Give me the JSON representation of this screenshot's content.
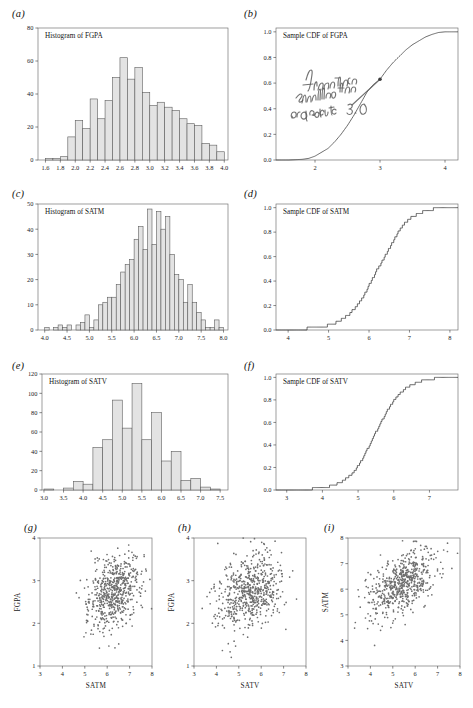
{
  "figure": {
    "panel_labels": [
      "(a)",
      "(b)",
      "(c)",
      "(d)",
      "(e)",
      "(f)",
      "(g)",
      "(h)",
      "(i)"
    ],
    "background": "#ffffff",
    "bar_fill": "#e3e3e3",
    "bar_stroke": "#5d5d5d",
    "line_color": "#3a3a3a",
    "dot_color": "#6e6e6e"
  },
  "annotation": {
    "text": "fraction smaller than or equal to 3.0",
    "panel": "(b)",
    "marker_x": 3.0,
    "marker_y": 0.63
  },
  "chart_data": [
    {
      "panel": "(a)",
      "type": "bar",
      "title": "Histogram of FGPA",
      "xlabel": "",
      "ylabel": "",
      "xlim": [
        1.5,
        4.05
      ],
      "ylim": [
        0,
        80
      ],
      "xticks": [
        1.6,
        1.8,
        2.0,
        2.2,
        2.4,
        2.6,
        2.8,
        3.0,
        3.2,
        3.4,
        3.6,
        3.8,
        4.0
      ],
      "xticklabels": [
        "1.6",
        "1.8",
        "2.0",
        "2.2",
        "2.4",
        "2.6",
        "2.8",
        "3.0",
        "3.2",
        "3.4",
        "3.6",
        "3.8",
        "4.0"
      ],
      "yticks": [
        0,
        20,
        40,
        60,
        80
      ],
      "yticklabels": [
        "0",
        "20",
        "40",
        "60",
        "80"
      ],
      "bin_width": 0.1,
      "bin_starts": [
        1.5,
        1.6,
        1.7,
        1.8,
        1.9,
        2.0,
        2.1,
        2.2,
        2.3,
        2.4,
        2.5,
        2.6,
        2.7,
        2.8,
        2.9,
        3.0,
        3.1,
        3.2,
        3.3,
        3.4,
        3.5,
        3.6,
        3.7,
        3.8,
        3.9
      ],
      "values": [
        0,
        1,
        1,
        2,
        14,
        24,
        19,
        37,
        25,
        36,
        50,
        62,
        49,
        56,
        41,
        33,
        35,
        32,
        30,
        25,
        22,
        21,
        10,
        9,
        5
      ],
      "grid": false,
      "legend": "none"
    },
    {
      "panel": "(b)",
      "type": "line",
      "title": "Sample CDF of FGPA",
      "xlabel": "",
      "ylabel": "",
      "xlim": [
        1.4,
        4.2
      ],
      "ylim": [
        0.0,
        1.03
      ],
      "xticks": [
        2,
        3,
        4
      ],
      "xticklabels": [
        "2",
        "3",
        "4"
      ],
      "yticks": [
        0.0,
        0.2,
        0.4,
        0.6,
        0.8,
        1.0
      ],
      "yticklabels": [
        "0.0",
        "0.2",
        "0.4",
        "0.6",
        "0.8",
        "1.0"
      ],
      "x": [
        1.4,
        1.6,
        1.8,
        1.9,
        2.0,
        2.1,
        2.2,
        2.3,
        2.4,
        2.5,
        2.6,
        2.7,
        2.8,
        2.9,
        3.0,
        3.1,
        3.2,
        3.3,
        3.4,
        3.5,
        3.6,
        3.7,
        3.8,
        3.9,
        4.0,
        4.2
      ],
      "y": [
        0.0,
        0.0,
        0.005,
        0.012,
        0.03,
        0.06,
        0.09,
        0.14,
        0.2,
        0.27,
        0.35,
        0.44,
        0.53,
        0.59,
        0.63,
        0.7,
        0.76,
        0.81,
        0.86,
        0.9,
        0.93,
        0.96,
        0.98,
        0.995,
        1.0,
        1.0
      ],
      "grid": false,
      "legend": "none"
    },
    {
      "panel": "(c)",
      "type": "bar",
      "title": "Histogram of SATM",
      "xlabel": "",
      "ylabel": "",
      "xlim": [
        3.85,
        8.1
      ],
      "ylim": [
        0,
        50
      ],
      "xticks": [
        4.0,
        4.5,
        5.0,
        5.5,
        6.0,
        6.5,
        7.0,
        7.5,
        8.0
      ],
      "xticklabels": [
        "4.0",
        "4.5",
        "5.0",
        "5.5",
        "6.0",
        "6.5",
        "7.0",
        "7.5",
        "8.0"
      ],
      "yticks": [
        0,
        10,
        20,
        30,
        40,
        50
      ],
      "yticklabels": [
        "0",
        "10",
        "20",
        "30",
        "40",
        "50"
      ],
      "bin_width": 0.1,
      "bin_starts": [
        3.9,
        4.0,
        4.1,
        4.2,
        4.3,
        4.4,
        4.5,
        4.6,
        4.7,
        4.8,
        4.9,
        5.0,
        5.1,
        5.2,
        5.3,
        5.4,
        5.5,
        5.6,
        5.7,
        5.8,
        5.9,
        6.0,
        6.1,
        6.2,
        6.3,
        6.4,
        6.5,
        6.6,
        6.7,
        6.8,
        6.9,
        7.0,
        7.1,
        7.2,
        7.3,
        7.4,
        7.5,
        7.6,
        7.7,
        7.8,
        7.9
      ],
      "values": [
        0,
        1,
        0,
        1,
        2,
        1,
        2,
        0,
        2,
        3,
        6,
        1,
        4,
        10,
        11,
        13,
        13,
        18,
        23,
        26,
        28,
        36,
        41,
        32,
        48,
        34,
        47,
        40,
        45,
        30,
        22,
        20,
        11,
        18,
        11,
        7,
        4,
        1,
        1,
        4,
        1
      ],
      "grid": false,
      "legend": "none"
    },
    {
      "panel": "(d)",
      "type": "line",
      "title": "Sample CDF of SATM",
      "xlabel": "",
      "ylabel": "",
      "xlim": [
        3.7,
        8.2
      ],
      "ylim": [
        0.0,
        1.03
      ],
      "xticks": [
        4,
        5,
        6,
        7,
        8
      ],
      "xticklabels": [
        "4",
        "5",
        "6",
        "7",
        "8"
      ],
      "yticks": [
        0.0,
        0.2,
        0.4,
        0.6,
        0.8,
        1.0
      ],
      "yticklabels": [
        "0.0",
        "0.2",
        "0.4",
        "0.6",
        "0.8",
        "1.0"
      ],
      "x": [
        3.7,
        4.0,
        4.3,
        4.6,
        4.9,
        5.1,
        5.3,
        5.5,
        5.7,
        5.9,
        6.0,
        6.1,
        6.2,
        6.3,
        6.4,
        6.5,
        6.6,
        6.7,
        6.8,
        6.9,
        7.0,
        7.2,
        7.4,
        7.6,
        7.8,
        8.0,
        8.2
      ],
      "y": [
        0.0,
        0.002,
        0.008,
        0.015,
        0.03,
        0.05,
        0.08,
        0.13,
        0.2,
        0.3,
        0.37,
        0.43,
        0.5,
        0.55,
        0.61,
        0.67,
        0.73,
        0.79,
        0.84,
        0.88,
        0.91,
        0.95,
        0.975,
        0.99,
        0.997,
        1.0,
        1.0
      ],
      "grid": false,
      "legend": "none"
    },
    {
      "panel": "(e)",
      "type": "bar",
      "title": "Histogram of SATV",
      "xlabel": "",
      "ylabel": "",
      "xlim": [
        2.95,
        7.7
      ],
      "ylim": [
        0,
        120
      ],
      "xticks": [
        3.0,
        3.5,
        4.0,
        4.5,
        5.0,
        5.5,
        6.0,
        6.5,
        7.0,
        7.5
      ],
      "xticklabels": [
        "3.0",
        "3.5",
        "4.0",
        "4.5",
        "5.0",
        "5.5",
        "6.0",
        "6.5",
        "7.0",
        "7.5"
      ],
      "yticks": [
        0,
        20,
        40,
        60,
        80,
        100,
        120
      ],
      "yticklabels": [
        "0",
        "20",
        "40",
        "60",
        "80",
        "100",
        "120"
      ],
      "bin_width": 0.25,
      "bin_starts": [
        3.0,
        3.25,
        3.5,
        3.75,
        4.0,
        4.25,
        4.5,
        4.75,
        5.0,
        5.25,
        5.5,
        5.75,
        6.0,
        6.25,
        6.5,
        6.75,
        7.0,
        7.25,
        7.5
      ],
      "values": [
        1,
        0,
        2,
        9,
        6,
        44,
        52,
        93,
        64,
        110,
        52,
        80,
        30,
        40,
        10,
        12,
        3,
        1,
        0
      ],
      "grid": false,
      "legend": "none"
    },
    {
      "panel": "(f)",
      "type": "line",
      "title": "Sample CDF of SATV",
      "xlabel": "",
      "ylabel": "",
      "xlim": [
        2.7,
        7.8
      ],
      "ylim": [
        0.0,
        1.03
      ],
      "xticks": [
        3,
        4,
        5,
        6,
        7
      ],
      "xticklabels": [
        "3",
        "4",
        "5",
        "6",
        "7"
      ],
      "yticks": [
        0.0,
        0.2,
        0.4,
        0.6,
        0.8,
        1.0
      ],
      "yticklabels": [
        "0.0",
        "0.2",
        "0.4",
        "0.6",
        "0.8",
        "1.0"
      ],
      "x": [
        2.7,
        3.2,
        3.6,
        4.0,
        4.3,
        4.5,
        4.7,
        4.9,
        5.0,
        5.1,
        5.2,
        5.3,
        5.4,
        5.5,
        5.6,
        5.7,
        5.8,
        5.9,
        6.0,
        6.2,
        6.4,
        6.6,
        6.8,
        7.0,
        7.3,
        7.6,
        7.8
      ],
      "y": [
        0.0,
        0.003,
        0.008,
        0.02,
        0.04,
        0.07,
        0.11,
        0.17,
        0.22,
        0.27,
        0.33,
        0.39,
        0.45,
        0.52,
        0.58,
        0.64,
        0.7,
        0.75,
        0.8,
        0.87,
        0.92,
        0.95,
        0.97,
        0.985,
        0.995,
        1.0,
        1.0
      ],
      "grid": false,
      "legend": "none"
    },
    {
      "panel": "(g)",
      "type": "scatter",
      "title": "",
      "xlabel": "SATM",
      "ylabel": "FGPA",
      "xlim": [
        3,
        8
      ],
      "ylim": [
        1,
        4
      ],
      "xticks": [
        3,
        4,
        5,
        6,
        7,
        8
      ],
      "xticklabels": [
        "3",
        "4",
        "5",
        "6",
        "7",
        "8"
      ],
      "yticks": [
        1,
        2,
        3,
        4
      ],
      "yticklabels": [
        "1",
        "2",
        "3",
        "4"
      ],
      "n_points": 609,
      "x_mean": 6.25,
      "x_sd": 0.62,
      "y_mean": 2.72,
      "y_sd": 0.42,
      "correlation": 0.3,
      "grid": false,
      "legend": "none"
    },
    {
      "panel": "(h)",
      "type": "scatter",
      "title": "",
      "xlabel": "SATV",
      "ylabel": "FGPA",
      "xlim": [
        3,
        8
      ],
      "ylim": [
        1,
        4
      ],
      "xticks": [
        3,
        4,
        5,
        6,
        7,
        8
      ],
      "xticklabels": [
        "3",
        "4",
        "5",
        "6",
        "7",
        "8"
      ],
      "yticks": [
        1,
        2,
        3,
        4
      ],
      "yticklabels": [
        "1",
        "2",
        "3",
        "4"
      ],
      "n_points": 609,
      "x_mean": 5.45,
      "x_sd": 0.72,
      "y_mean": 2.72,
      "y_sd": 0.42,
      "correlation": 0.25,
      "grid": false,
      "legend": "none"
    },
    {
      "panel": "(i)",
      "type": "scatter",
      "title": "",
      "xlabel": "SATV",
      "ylabel": "SATM",
      "xlim": [
        3,
        8
      ],
      "ylim": [
        3,
        8
      ],
      "xticks": [
        3,
        4,
        5,
        6,
        7,
        8
      ],
      "xticklabels": [
        "3",
        "4",
        "5",
        "6",
        "7",
        "8"
      ],
      "yticks": [
        3,
        4,
        5,
        6,
        7,
        8
      ],
      "yticklabels": [
        "3",
        "4",
        "5",
        "6",
        "7",
        "8"
      ],
      "n_points": 609,
      "x_mean": 5.45,
      "x_sd": 0.72,
      "y_mean": 6.25,
      "y_sd": 0.62,
      "correlation": 0.47,
      "grid": false,
      "legend": "none"
    }
  ]
}
